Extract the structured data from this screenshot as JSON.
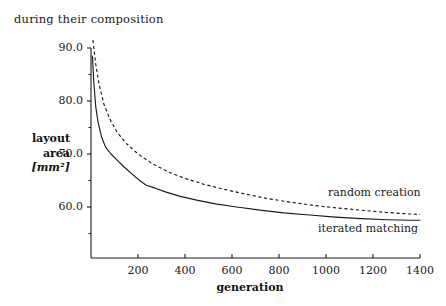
{
  "caption": "during their composition",
  "axes": {
    "x_title": "generation",
    "y_title_line1": "layout",
    "y_title_line2": "area",
    "y_title_unit": "[mm²]",
    "x_ticks": [
      "200",
      "400",
      "600",
      "800",
      "1000",
      "1200",
      "1400"
    ],
    "y_ticks": [
      "90.0",
      "80.0",
      "70.0",
      "60.0"
    ]
  },
  "annotations": {
    "random_creation": "random creation",
    "iterated_matching": "iterated matching"
  },
  "chart_data": {
    "type": "line",
    "title": "during their composition",
    "xlabel": "generation",
    "ylabel": "layout area [mm²]",
    "xlim": [
      0,
      1400
    ],
    "ylim": [
      53.5,
      90.0
    ],
    "grid": false,
    "legend_position": "inline-right",
    "x_ticks": [
      200,
      400,
      600,
      800,
      1000,
      1200,
      1400
    ],
    "y_ticks": [
      60.0,
      70.0,
      80.0,
      90.0
    ],
    "y_minor_ticks": [
      55.0,
      65.0,
      75.0,
      85.0
    ],
    "series": [
      {
        "name": "random creation",
        "style": "dashed",
        "color": "#1a1a1a",
        "x": [
          8,
          20,
          35,
          55,
          80,
          110,
          150,
          200,
          260,
          330,
          400,
          480,
          560,
          650,
          750,
          850,
          950,
          1050,
          1150,
          1250,
          1350,
          1400
        ],
        "y": [
          91.5,
          87.0,
          83.0,
          79.4,
          76.6,
          74.2,
          72.0,
          70.0,
          68.2,
          66.6,
          65.4,
          64.3,
          63.4,
          62.5,
          61.6,
          60.9,
          60.3,
          59.8,
          59.4,
          59.0,
          58.7,
          58.6
        ]
      },
      {
        "name": "iterated matching",
        "style": "solid",
        "color": "#1a1a1a",
        "x": [
          6,
          12,
          20,
          30,
          45,
          62,
          85,
          110,
          140,
          175,
          210,
          235,
          270,
          320,
          380,
          450,
          530,
          620,
          720,
          820,
          930,
          1040,
          1150,
          1260,
          1360,
          1400
        ],
        "y": [
          88.5,
          83.5,
          79.0,
          76.0,
          73.2,
          71.3,
          70.0,
          68.9,
          67.6,
          66.2,
          64.9,
          64.1,
          63.6,
          62.8,
          62.0,
          61.3,
          60.6,
          60.0,
          59.4,
          58.9,
          58.5,
          58.1,
          57.8,
          57.6,
          57.5,
          57.5
        ]
      }
    ]
  },
  "geometry": {
    "plot_left_px": 91,
    "plot_right_px": 420,
    "y90_px": 48,
    "y60_px": 207,
    "x_axis_px": 258,
    "plot_top_px": 48
  }
}
